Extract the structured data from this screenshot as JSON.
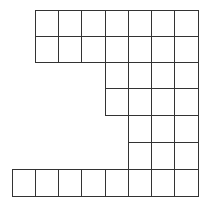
{
  "diagram": {
    "type": "grid-shape",
    "line_color": "#333333",
    "background": "#ffffff",
    "origin_x": 12,
    "origin_y": 10,
    "cell_width": 23.25,
    "row_tops": [
      10,
      36,
      62,
      88,
      115,
      142,
      169
    ],
    "row_height": [
      26,
      26,
      26,
      27,
      27,
      27,
      27
    ],
    "rows": [
      {
        "row": 0,
        "cols": [
          1,
          2,
          3,
          4,
          5,
          6,
          7
        ]
      },
      {
        "row": 1,
        "cols": [
          1,
          2,
          3,
          4,
          5,
          6,
          7
        ]
      },
      {
        "row": 2,
        "cols": [
          4,
          5,
          6,
          7
        ]
      },
      {
        "row": 3,
        "cols": [
          4,
          5,
          6,
          7
        ]
      },
      {
        "row": 4,
        "cols": [
          5,
          6,
          7
        ]
      },
      {
        "row": 5,
        "cols": [
          5,
          6,
          7
        ]
      },
      {
        "row": 6,
        "cols": [
          0,
          1,
          2,
          3,
          4,
          5,
          6,
          7
        ]
      }
    ],
    "total_squares": 37
  }
}
